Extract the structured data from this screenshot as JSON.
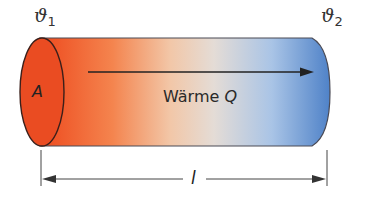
{
  "labels": {
    "theta1_symbol": "ϑ",
    "theta1_sub": "1",
    "theta2_symbol": "ϑ",
    "theta2_sub": "2",
    "area": "A",
    "heat_text": "Wärme ",
    "heat_symbol": "Q",
    "length": "l"
  },
  "colors": {
    "hot": "#ee4a1e",
    "warm": "#f6a27a",
    "neutral": "#ece0d6",
    "cool": "#a9c4e6",
    "cold": "#4f82c8",
    "outline": "#3a2a2a",
    "arrow": "#222222"
  }
}
